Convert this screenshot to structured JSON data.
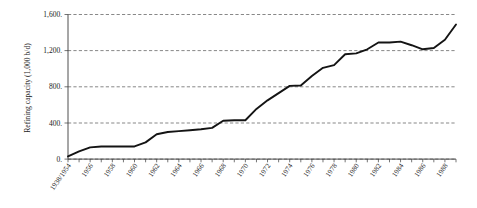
{
  "chart_data": {
    "type": "line",
    "title": "",
    "xlabel": "",
    "ylabel": "Refining capacity (1,000 b/d)",
    "ylim": [
      0,
      1600
    ],
    "yticks": [
      0,
      400,
      800,
      1200,
      1600
    ],
    "ytick_labels": [
      "0.",
      "400.",
      "800.",
      "1,200.",
      "1,600."
    ],
    "grid": true,
    "legend": "none",
    "categories": [
      "1938/1954",
      "1955",
      "1956",
      "1957",
      "1958",
      "1959",
      "1960",
      "1961",
      "1962",
      "1963",
      "1964",
      "1965",
      "1966",
      "1967",
      "1968",
      "1969",
      "1970",
      "1971",
      "1972",
      "1973",
      "1974",
      "1975",
      "1976",
      "1977",
      "1978",
      "1979",
      "1980",
      "1981",
      "1982",
      "1983",
      "1984",
      "1985",
      "1986",
      "1987",
      "1988",
      "1989"
    ],
    "xtick_labels": [
      "1938/1954",
      "1956",
      "1958",
      "1960",
      "1962",
      "1964",
      "1966",
      "1968",
      "1970",
      "1972",
      "1974",
      "1976",
      "1978",
      "1980",
      "1982",
      "1984",
      "1986",
      "1988"
    ],
    "values": [
      30,
      85,
      130,
      140,
      140,
      140,
      140,
      185,
      275,
      300,
      310,
      320,
      330,
      345,
      425,
      430,
      430,
      555,
      650,
      730,
      810,
      815,
      920,
      1010,
      1040,
      1160,
      1170,
      1215,
      1290,
      1290,
      1300,
      1260,
      1215,
      1230,
      1320,
      1490
    ],
    "series_name": "Refining capacity",
    "line_color": "#141414",
    "grid_color": "#555555"
  }
}
